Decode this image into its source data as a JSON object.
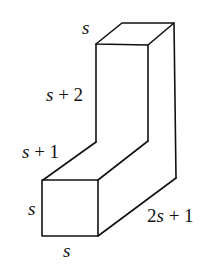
{
  "figure": {
    "type": "3d-solid-L-shape"
  },
  "labels": {
    "top_depth": "s",
    "upper_height": "s + 2",
    "slant_length": "s + 1",
    "front_height": "s",
    "front_width": "s",
    "base_length": "2s + 1"
  },
  "label_parts": {
    "top_depth": {
      "var": "s",
      "rest": ""
    },
    "upper_height": {
      "var": "s",
      "rest": " + 2"
    },
    "slant_length": {
      "var": "s",
      "rest": " + 1"
    },
    "front_height": {
      "var": "s",
      "rest": ""
    },
    "front_width": {
      "var": "s",
      "rest": ""
    },
    "base_length": {
      "coef": "2",
      "var": "s",
      "rest": " + 1"
    }
  },
  "colors": {
    "stroke": "#111111",
    "background": "#ffffff"
  }
}
